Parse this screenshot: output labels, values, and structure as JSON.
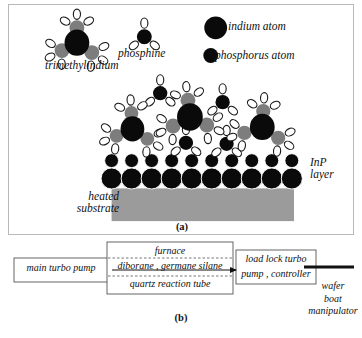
{
  "figure": {
    "panels": [
      {
        "id": "a",
        "caption": "(a)",
        "title_implied": "MOCVD surface growth schematic"
      },
      {
        "id": "b",
        "caption": "(b)",
        "title_implied": "Reactor system block diagram"
      }
    ]
  },
  "panel_a": {
    "caption": "(a)",
    "labels": {
      "trimethylindium": "trimethylindium",
      "phosphine": "phosphine",
      "inp_layer": "InP\nlayer",
      "heated_substrate": "heated\nsubstrate"
    },
    "legend": [
      {
        "label": "indium atom",
        "kind": "indium",
        "radius": 11,
        "color": "#0a0a0a"
      },
      {
        "label": "phosphorus atom",
        "kind": "phosphorus",
        "radius": 7,
        "color": "#0a0a0a"
      }
    ],
    "colors": {
      "indium": "#0a0a0a",
      "phosphorus": "#0a0a0a",
      "methyl": "#7d7d7d",
      "hydrogen_fill": "#ffffff",
      "hydrogen_stroke": "#1a1a1a",
      "substrate": "#9b9b9b",
      "panel_border": "#b9b9b9"
    },
    "legend_markers": [
      {
        "name": "legend-indium-circle",
        "cx": 208,
        "cy": 23,
        "r": 11.5
      },
      {
        "name": "legend-phosphorus-circle",
        "cx": 203,
        "cy": 51,
        "r": 7.5
      }
    ],
    "gas_phase_molecules": [
      {
        "type": "trimethylindium",
        "name": "tmi-legend-molecule",
        "cx": 68,
        "cy": 38,
        "r_center": 12.5,
        "methyls": [
          {
            "dx": 0,
            "dy": -15,
            "r": 7.5
          },
          {
            "dx": -15,
            "dy": 8,
            "r": 7.5
          },
          {
            "dx": 15,
            "dy": 10,
            "r": 7.5
          }
        ]
      },
      {
        "type": "phosphine",
        "name": "phosphine-legend-molecule",
        "cx": 136,
        "cy": 32,
        "r_center": 7.5
      }
    ],
    "surface_cluster": [
      {
        "type": "trimethylindium",
        "name": "tmi-surface-1",
        "cx": 124,
        "cy": 125,
        "r_center": 12.0,
        "methyls": [
          {
            "dx": -1,
            "dy": -16,
            "r": 7.0
          },
          {
            "dx": -16,
            "dy": 7,
            "r": 7.0
          },
          {
            "dx": 15,
            "dy": 10,
            "r": 7.0
          }
        ]
      },
      {
        "type": "trimethylindium",
        "name": "tmi-surface-2",
        "cx": 182,
        "cy": 113,
        "r_center": 13.0,
        "methyls": [
          {
            "dx": -2,
            "dy": -17,
            "r": 7.5
          },
          {
            "dx": -17,
            "dy": 9,
            "r": 7.5
          },
          {
            "dx": 17,
            "dy": 8,
            "r": 7.5
          }
        ]
      },
      {
        "type": "trimethylindium",
        "name": "tmi-surface-3",
        "cx": 255,
        "cy": 123,
        "r_center": 12.5,
        "methyls": [
          {
            "dx": 1,
            "dy": -16,
            "r": 7.2
          },
          {
            "dx": -18,
            "dy": 6,
            "r": 7.2
          },
          {
            "dx": 16,
            "dy": 11,
            "r": 7.2
          }
        ]
      },
      {
        "type": "phosphine",
        "name": "phosphine-surface-1",
        "cx": 152,
        "cy": 89,
        "r_center": 7.2
      },
      {
        "type": "phosphine",
        "name": "phosphine-surface-2",
        "cx": 215,
        "cy": 98,
        "r_center": 7.2
      },
      {
        "type": "phosphine",
        "name": "phosphine-surface-3",
        "cx": 178,
        "cy": 139,
        "r_center": 7.2
      },
      {
        "type": "phosphine",
        "name": "phosphine-surface-4",
        "cx": 219,
        "cy": 140,
        "r_center": 7.2
      }
    ],
    "inp_layer": {
      "name": "inp-layer-lattice",
      "phosphorus_row": {
        "count": 10,
        "x_start": 103,
        "x_step": 20.2,
        "cy": 157,
        "r": 7.0
      },
      "indium_row": {
        "count": 10,
        "x_start": 103,
        "x_step": 20.2,
        "cy": 175,
        "r": 10.6
      }
    },
    "substrate_rect": {
      "name": "heated-substrate-block",
      "x": 103,
      "y": 185,
      "width": 184,
      "height": 33
    }
  },
  "panel_b": {
    "caption": "(b)",
    "boxes": [
      {
        "name": "main-turbo-pump-box",
        "label": "main turbo pump",
        "x": 6,
        "y": 18,
        "width": 94,
        "height": 24
      },
      {
        "name": "furnace-box",
        "label": "furnace",
        "x": 99,
        "y": 2,
        "width": 126,
        "height": 52
      },
      {
        "name": "load-lock-box",
        "label": "load lock turbo\npump , controller",
        "x": 228,
        "y": 10,
        "width": 80,
        "height": 34
      }
    ],
    "inner_labels": {
      "furnace": "furnace",
      "gas_line": "diborane , germane silane",
      "quartz_tube": "quartz reaction tube"
    },
    "dashed_lines": [
      {
        "name": "reaction-tube-top-dashed",
        "x1": 100,
        "y1": 18,
        "x2": 224,
        "y2": 18
      },
      {
        "name": "reaction-tube-bottom-dashed",
        "x1": 100,
        "y1": 36,
        "x2": 224,
        "y2": 36
      }
    ],
    "gas_flow_arrow": {
      "name": "gas-flow-arrow",
      "x1": 104,
      "y1": 30,
      "x2": 228,
      "y2": 30,
      "direction": "right"
    },
    "manipulator_rod": {
      "name": "wafer-boat-manipulator-rod",
      "x1": 296,
      "y1": 27,
      "x2": 346,
      "y2": 27,
      "thickness": 3
    },
    "wafer_boat_label": "wafer\nboat\nmanipulator"
  }
}
